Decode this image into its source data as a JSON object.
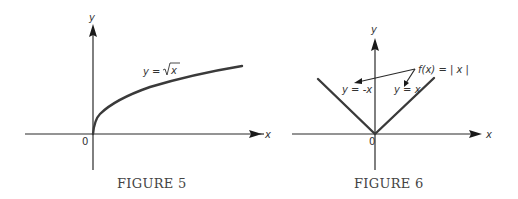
{
  "figures": [
    {
      "caption": "FIGURE 5",
      "x_axis_label": "x",
      "y_axis_label": "y",
      "origin_label": "0",
      "curve_label_prefix": "y = ",
      "curve_label_radicand": "x",
      "function": "y = sqrt(x)"
    },
    {
      "caption": "FIGURE 6",
      "x_axis_label": "x",
      "y_axis_label": "y",
      "origin_label": "0",
      "function_label": "f(x) = | x |",
      "left_branch_label": "y = -x",
      "right_branch_label": "y = x",
      "function": "f(x) = |x|"
    }
  ],
  "colors": {
    "axis": "#2a2a2a",
    "curve": "#3a3a3a",
    "text": "#333333"
  }
}
